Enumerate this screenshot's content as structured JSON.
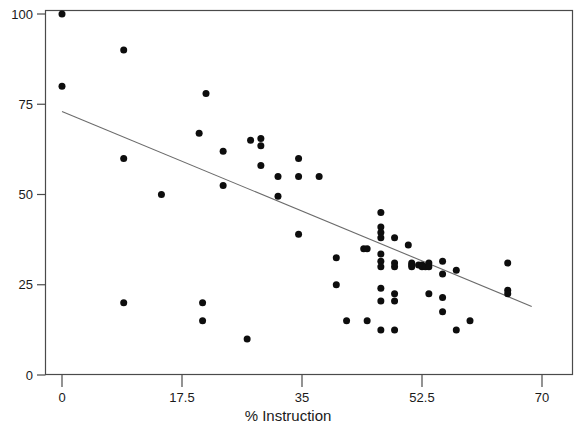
{
  "chart_data": {
    "type": "scatter",
    "title": "",
    "subtitle": "",
    "xlabel": "% Instruction",
    "ylabel": "",
    "xlim": [
      0,
      70
    ],
    "ylim": [
      0,
      100
    ],
    "xticks": [
      0,
      17.5,
      35,
      52.5,
      70
    ],
    "xtick_labels": [
      "0",
      "17.5",
      "35",
      "52.5",
      "70"
    ],
    "yticks": [
      0,
      25,
      50,
      75,
      100
    ],
    "ytick_labels": [
      "0",
      "25",
      "50",
      "75",
      "100"
    ],
    "grid": false,
    "legend": null,
    "legend_position": "none",
    "marker": "filled-circle",
    "marker_color": "#0d0d0d",
    "marker_size": 7,
    "frame_color": "#4a4a4a",
    "background_color": "#ffffff",
    "annotations": [],
    "series": [
      {
        "name": "observations",
        "type": "scatter",
        "points": [
          [
            0.0,
            100.0
          ],
          [
            0.0,
            80.0
          ],
          [
            9.0,
            90.0
          ],
          [
            9.0,
            60.0
          ],
          [
            9.0,
            20.0
          ],
          [
            14.5,
            50.0
          ],
          [
            20.0,
            67.0
          ],
          [
            21.0,
            78.0
          ],
          [
            20.5,
            20.0
          ],
          [
            20.5,
            15.0
          ],
          [
            23.5,
            62.0
          ],
          [
            23.5,
            52.5
          ],
          [
            27.0,
            10.0
          ],
          [
            27.5,
            65.0
          ],
          [
            29.0,
            65.5
          ],
          [
            29.0,
            63.5
          ],
          [
            29.0,
            58.0
          ],
          [
            31.5,
            55.0
          ],
          [
            31.5,
            49.5
          ],
          [
            34.5,
            60.0
          ],
          [
            34.5,
            55.0
          ],
          [
            34.5,
            39.0
          ],
          [
            37.5,
            55.0
          ],
          [
            40.0,
            32.5
          ],
          [
            40.0,
            25.0
          ],
          [
            41.5,
            15.0
          ],
          [
            44.0,
            35.0
          ],
          [
            44.5,
            35.0
          ],
          [
            44.5,
            15.0
          ],
          [
            46.5,
            45.0
          ],
          [
            46.5,
            41.0
          ],
          [
            46.5,
            39.5
          ],
          [
            46.5,
            38.0
          ],
          [
            46.5,
            33.5
          ],
          [
            46.5,
            31.5
          ],
          [
            46.5,
            30.0
          ],
          [
            46.5,
            24.0
          ],
          [
            46.5,
            20.5
          ],
          [
            46.5,
            12.5
          ],
          [
            48.5,
            38.0
          ],
          [
            48.5,
            31.0
          ],
          [
            48.5,
            30.0
          ],
          [
            48.5,
            22.5
          ],
          [
            48.5,
            20.5
          ],
          [
            48.5,
            12.5
          ],
          [
            50.5,
            36.0
          ],
          [
            51.0,
            31.0
          ],
          [
            51.0,
            30.5
          ],
          [
            51.0,
            30.0
          ],
          [
            52.0,
            30.5
          ],
          [
            52.5,
            30.5
          ],
          [
            52.5,
            30.0
          ],
          [
            53.0,
            30.0
          ],
          [
            53.5,
            31.0
          ],
          [
            53.5,
            30.0
          ],
          [
            53.5,
            22.5
          ],
          [
            55.5,
            31.5
          ],
          [
            55.5,
            28.0
          ],
          [
            55.5,
            21.5
          ],
          [
            55.5,
            17.5
          ],
          [
            57.5,
            29.0
          ],
          [
            57.5,
            12.5
          ],
          [
            59.5,
            15.0
          ],
          [
            65.0,
            31.0
          ],
          [
            65.0,
            23.5
          ],
          [
            65.0,
            22.5
          ]
        ]
      },
      {
        "name": "fit-line",
        "type": "line",
        "points": [
          [
            0.0,
            73.0
          ],
          [
            68.5,
            19.0
          ]
        ]
      }
    ]
  }
}
